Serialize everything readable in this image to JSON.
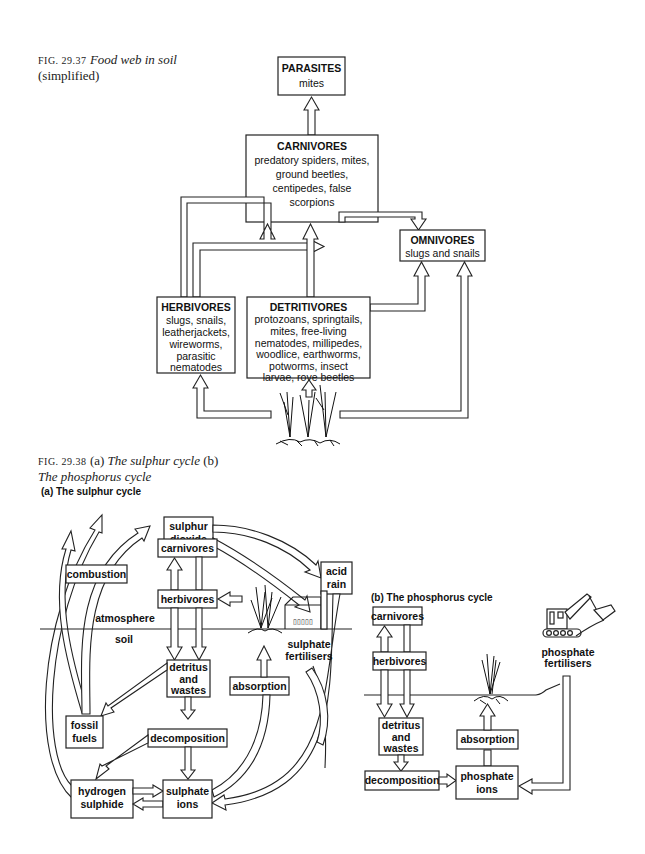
{
  "fig1": {
    "number": "FIG. 29.37",
    "title": "Food web in soil",
    "subtitle": "(simplified)",
    "nodes": {
      "parasites": {
        "title": "PARASITES",
        "lines": [
          "mites"
        ]
      },
      "carnivores": {
        "title": "CARNIVORES",
        "lines": [
          "predatory spiders, mites,",
          "ground beetles,",
          "centipedes, false",
          "scorpions"
        ]
      },
      "omnivores": {
        "title": "OMNIVORES",
        "lines": [
          "slugs and snails"
        ]
      },
      "herbivores": {
        "title": "HERBIVORES",
        "lines": [
          "slugs, snails,",
          "leatherjackets,",
          "wireworms,",
          "parasitic",
          "nematodes"
        ]
      },
      "detritivores": {
        "title": "DETRITIVORES",
        "lines": [
          "protozoans, springtails,",
          "mites, free-living",
          "nematodes, millipedes,",
          "woodlice, earthworms,",
          "potworms, insect",
          "larvae, rove beetles"
        ]
      }
    }
  },
  "fig2": {
    "number": "FIG. 29.38",
    "caption_a": "(a)",
    "title_a": "The sulphur cycle",
    "caption_b": "(b)",
    "title_b": "The phosphorus cycle"
  },
  "sulphur": {
    "heading": "(a) The sulphur cycle",
    "sulphur_dioxide": [
      "sulphur",
      "dioxide"
    ],
    "acid_rain": [
      "acid",
      "rain"
    ],
    "carnivores": "carnivores",
    "combustion": "combustion",
    "herbivores": "herbivores",
    "atmosphere": "atmosphere",
    "soil": "soil",
    "sulphate_fertilisers": [
      "sulphate",
      "fertilisers"
    ],
    "detritus": [
      "detritus",
      "and",
      "wastes"
    ],
    "absorption": "absorption",
    "fossil_fuels": [
      "fossil",
      "fuels"
    ],
    "decomposition": "decomposition",
    "hydrogen_sulphide": [
      "hydrogen",
      "sulphide"
    ],
    "sulphate_ions": [
      "sulphate",
      "ions"
    ]
  },
  "phosphorus": {
    "heading": "(b) The phosphorus cycle",
    "carnivores": "carnivores",
    "herbivores": "herbivores",
    "detritus": [
      "detritus",
      "and",
      "wastes"
    ],
    "decomposition": "decomposition",
    "absorption": "absorption",
    "phosphate_ions": [
      "phosphate",
      "ions"
    ],
    "phosphate_fertilisers": [
      "phosphate",
      "fertilisers"
    ]
  }
}
